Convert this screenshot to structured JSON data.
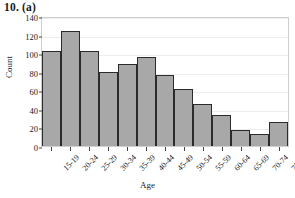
{
  "title": "10. (a)",
  "chart_data": {
    "type": "bar",
    "title": "10. (a)",
    "xlabel": "Age",
    "ylabel": "Count",
    "categories": [
      "15-19",
      "20-24",
      "25-29",
      "30-34",
      "35-39",
      "40-44",
      "45-49",
      "50-54",
      "55-59",
      "60-64",
      "65-69",
      "70-74",
      "75-79"
    ],
    "values": [
      102,
      124,
      102,
      80,
      88,
      96,
      77,
      61,
      45,
      33,
      17,
      13,
      26
    ],
    "ylim": [
      0,
      140
    ],
    "yticks": [
      0,
      20,
      40,
      60,
      80,
      100,
      120,
      140
    ],
    "grid": true,
    "legend": null,
    "bar_color": "#a8a8a8",
    "bar_edge_color": "#2b2b2b"
  }
}
